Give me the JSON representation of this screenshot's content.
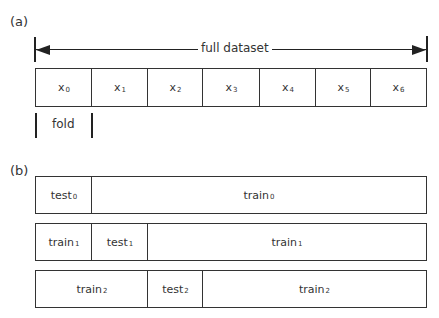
{
  "panel_a": {
    "label": "(a)",
    "span_label": "full dataset",
    "cells": [
      {
        "base": "x",
        "sub": "0"
      },
      {
        "base": "x",
        "sub": "1"
      },
      {
        "base": "x",
        "sub": "2"
      },
      {
        "base": "x",
        "sub": "3"
      },
      {
        "base": "x",
        "sub": "4"
      },
      {
        "base": "x",
        "sub": "5"
      },
      {
        "base": "x",
        "sub": "6"
      }
    ],
    "fold_label": "fold"
  },
  "panel_b": {
    "label": "(b)",
    "rows": [
      {
        "segments": [
          {
            "base": "test",
            "sub": "0",
            "role": "test",
            "span": 1
          },
          {
            "base": "train",
            "sub": "0",
            "role": "train",
            "span": 6
          }
        ]
      },
      {
        "segments": [
          {
            "base": "train",
            "sub": "1",
            "role": "train",
            "span": 1
          },
          {
            "base": "test",
            "sub": "1",
            "role": "test",
            "span": 1
          },
          {
            "base": "train",
            "sub": "1",
            "role": "train",
            "span": 5
          }
        ]
      },
      {
        "segments": [
          {
            "base": "train",
            "sub": "2",
            "role": "train",
            "span": 2
          },
          {
            "base": "test",
            "sub": "2",
            "role": "test",
            "span": 1
          },
          {
            "base": "train",
            "sub": "2",
            "role": "train",
            "span": 4
          }
        ]
      }
    ]
  },
  "colors": {
    "line": "#222222",
    "text": "#333333",
    "background": "#ffffff"
  }
}
